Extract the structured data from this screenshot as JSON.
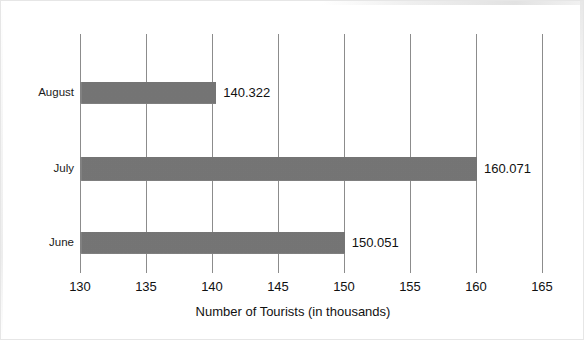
{
  "chart_data": {
    "type": "bar",
    "orientation": "horizontal",
    "title": "",
    "subtitle": "",
    "xlabel": "Number of Tourists (in thousands)",
    "ylabel": "",
    "categories": [
      "August",
      "July",
      "June"
    ],
    "values": [
      140.322,
      160.071,
      150.051
    ],
    "data_labels": [
      "140.322",
      "160.071",
      "150.051"
    ],
    "xlim": [
      130,
      165
    ],
    "xticks": [
      130,
      135,
      140,
      145,
      150,
      155,
      160,
      165
    ],
    "xtick_labels": [
      "130",
      "135",
      "140",
      "145",
      "150",
      "155",
      "160",
      "165"
    ],
    "grid": "vertical",
    "legend": "none",
    "bar_color": "#7d7d7d",
    "gridline_color": "#8c8c8c",
    "background_color": "#ffffff",
    "text_color": "#111111",
    "series": [
      {
        "name": "Number of Tourists (in thousands)",
        "points": [
          {
            "category": "August",
            "value": 140.322,
            "label": "140.322"
          },
          {
            "category": "July",
            "value": 160.071,
            "label": "160.071"
          },
          {
            "category": "June",
            "value": 150.051,
            "label": "150.051"
          }
        ]
      }
    ]
  }
}
